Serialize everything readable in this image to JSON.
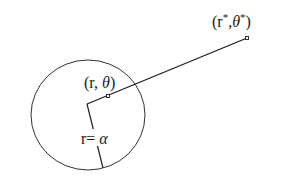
{
  "diagram": {
    "circle": {
      "cx": 88,
      "cy": 115,
      "rx": 57,
      "ry": 55
    },
    "center": {
      "x": 87,
      "y": 104
    },
    "inner_point": {
      "x": 108,
      "y": 96
    },
    "outer_point": {
      "x": 247,
      "y": 38
    },
    "radius_end": {
      "x": 103,
      "y": 168
    },
    "labels": {
      "outer_point": {
        "r": "r",
        "sup1": "*",
        "theta": "θ",
        "sup2": "*",
        "open": "(",
        "comma": ",",
        "close": ")"
      },
      "inner_point": {
        "open": "(",
        "r": "r, ",
        "theta": "θ",
        "close": ")"
      },
      "radius": {
        "text": "r= ",
        "alpha": "α"
      }
    },
    "colors": {
      "ink": "#1a1a1a",
      "background": "#ffffff"
    }
  }
}
